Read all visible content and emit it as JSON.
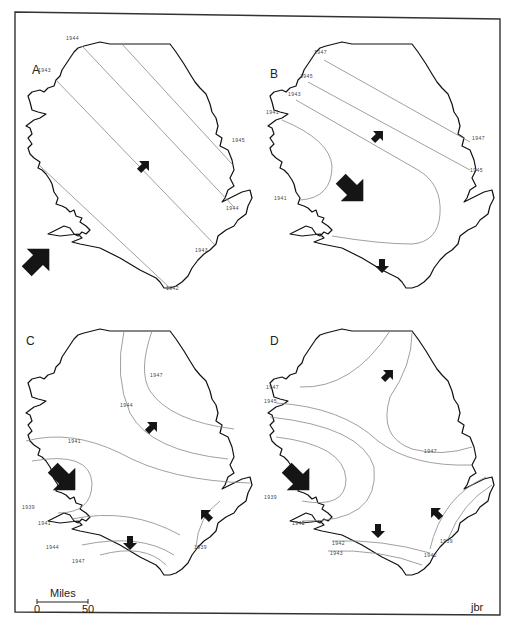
{
  "figure": {
    "credit": "jbr",
    "scale_bar": {
      "title": "Miles",
      "start_label": "0",
      "end_label": "50"
    }
  },
  "panels": [
    {
      "id": "A",
      "label": "A",
      "year_labels": [
        "1944",
        "1943",
        "1945",
        "1944",
        "1943",
        "1942"
      ],
      "arrows": [
        "small-northeast",
        "large-northeast"
      ]
    },
    {
      "id": "B",
      "label": "B",
      "year_labels": [
        "1947",
        "1945",
        "1943",
        "1941",
        "1941",
        "1947",
        "1945"
      ],
      "arrows": [
        "small-northeast",
        "large-southeast",
        "small-south"
      ]
    },
    {
      "id": "C",
      "label": "C",
      "year_labels": [
        "1947",
        "1944",
        "1941",
        "1939",
        "1941",
        "1944",
        "1947",
        "1939"
      ],
      "arrows": [
        "small-northeast",
        "large-southeast",
        "small-northwest",
        "small-south"
      ]
    },
    {
      "id": "D",
      "label": "D",
      "year_labels": [
        "1947",
        "1945",
        "1947",
        "1939",
        "1942",
        "1942",
        "1943",
        "1939",
        "1942"
      ],
      "arrows": [
        "small-northeast",
        "large-southeast",
        "small-northwest",
        "small-south"
      ]
    }
  ]
}
